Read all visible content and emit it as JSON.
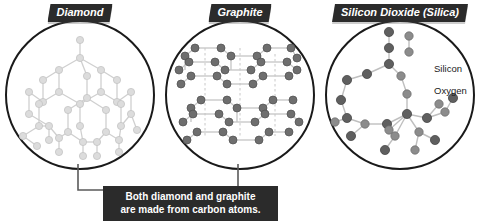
{
  "figure": {
    "title_hidden": "",
    "background_color": "#ffffff",
    "panels": [
      {
        "id": "diamond",
        "banner_label": "Diamond",
        "structure_name": "diamond-lattice",
        "atom_color": "#d6d6d6",
        "bond_color": "#cccccc",
        "circle_color": "#1a1a1a"
      },
      {
        "id": "graphite",
        "banner_label": "Graphite",
        "structure_name": "graphite-layers",
        "atom_color": "#6b6b6b",
        "bond_color": "#bdbdbd",
        "circle_color": "#1a1a1a"
      },
      {
        "id": "silica",
        "banner_label": "Silicon Dioxide (Silica)",
        "structure_name": "silica-network",
        "atom_color": "#707070",
        "bond_color": "#b5b5b5",
        "circle_color": "#1a1a1a"
      }
    ]
  },
  "legend": {
    "silicon_label": "Silicon",
    "oxygen_label": "Oxygen",
    "silicon_color": "#6b6b6b",
    "oxygen_color": "#8f8f8f"
  },
  "caption": {
    "line1": "Both diamond and graphite",
    "line2": "are made from carbon atoms.",
    "background_color": "#2b2b2b",
    "text_color": "#ffffff"
  }
}
